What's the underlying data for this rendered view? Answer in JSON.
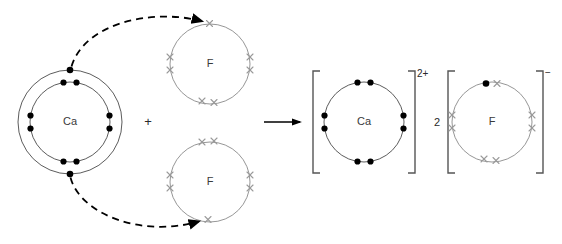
{
  "diagram": {
    "type": "dot-and-cross-diagram",
    "colors": {
      "background": "#ffffff",
      "shell_stroke": "#4a4a4a",
      "fluorine_shell_stroke": "#8a8a8a",
      "dot_electron": "#000000",
      "cross_electron": "#9a9a9a",
      "arrow": "#000000",
      "bracket": "#555555",
      "text": "#3a3a3a"
    },
    "operators": {
      "plus": "+",
      "reaction_arrow": "→"
    },
    "reactants": {
      "calcium": {
        "symbol": "Ca",
        "shells": 2,
        "inner_shell_electrons": 8,
        "outer_shell_electrons": 2,
        "electron_glyph": "dot",
        "center": {
          "x": 70,
          "y": 122
        },
        "inner_radius": 40,
        "outer_radius": 52
      },
      "fluorine_top": {
        "symbol": "F",
        "shells": 1,
        "outer_shell_electrons": 7,
        "electron_glyph": "cross",
        "center": {
          "x": 210,
          "y": 64
        },
        "radius": 40
      },
      "fluorine_bottom": {
        "symbol": "F",
        "shells": 1,
        "outer_shell_electrons": 7,
        "electron_glyph": "cross",
        "center": {
          "x": 210,
          "y": 182
        },
        "radius": 40
      }
    },
    "products": {
      "calcium_ion": {
        "symbol": "Ca",
        "charge": "2+",
        "shells": 1,
        "outer_shell_electrons": 8,
        "electron_glyph": "dot",
        "center": {
          "x": 364,
          "y": 122
        },
        "radius": 40,
        "bracketed": true
      },
      "fluoride_ion": {
        "symbol": "F",
        "charge": "−",
        "coefficient": "2",
        "shells": 1,
        "outer_shell_electrons": 8,
        "cross_electrons": 7,
        "dot_electrons": 1,
        "center": {
          "x": 492,
          "y": 122
        },
        "radius": 40,
        "bracketed": true
      }
    },
    "electron_transfers": [
      {
        "from": "calcium-outer-top",
        "to": "fluorine-top",
        "style": "dashed-curved-arrow"
      },
      {
        "from": "calcium-outer-bottom",
        "to": "fluorine-bottom",
        "style": "dashed-curved-arrow"
      }
    ]
  }
}
